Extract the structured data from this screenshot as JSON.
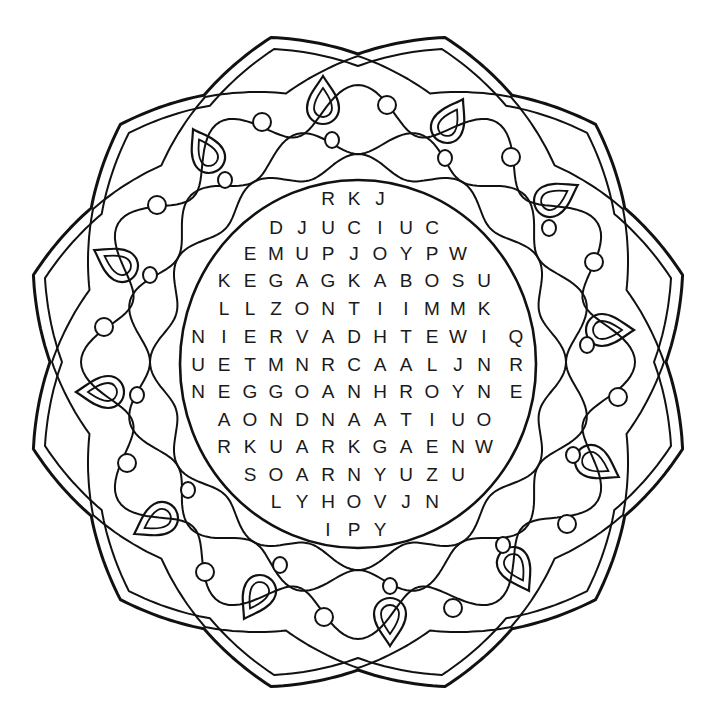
{
  "puzzle": {
    "type": "word-search",
    "style": "mandala coloring page",
    "ink_color": "#111111",
    "background": "#ffffff",
    "grid": {
      "col_x": [
        198,
        224,
        250,
        276,
        302,
        328,
        354,
        380,
        406,
        432,
        458,
        484,
        516
      ],
      "rows": [
        {
          "y": 199,
          "start_col": 5,
          "letters": "RKJ"
        },
        {
          "y": 228,
          "start_col": 3,
          "letters": "DJUCIUC"
        },
        {
          "y": 254,
          "start_col": 2,
          "letters": "EMUPJOYPW"
        },
        {
          "y": 281,
          "start_col": 1,
          "letters": "KEGAGKABOSU"
        },
        {
          "y": 309,
          "start_col": 1,
          "letters": "LLZONTIIMMK"
        },
        {
          "y": 337,
          "start_col": 0,
          "letters": "NIERVADHTEWIQ"
        },
        {
          "y": 365,
          "start_col": 0,
          "letters": "UETMNRCAALJNR"
        },
        {
          "y": 392,
          "start_col": 0,
          "letters": "NEGGOANHROYNE"
        },
        {
          "y": 420,
          "start_col": 1,
          "letters": "AONDNAATIUO"
        },
        {
          "y": 447,
          "start_col": 1,
          "letters": "RKUARKGAENW"
        },
        {
          "y": 475,
          "start_col": 2,
          "letters": "SOARNYUZU"
        },
        {
          "y": 502,
          "start_col": 3,
          "letters": "LYHOVJN"
        },
        {
          "y": 530,
          "start_col": 5,
          "letters": "IPY"
        }
      ]
    },
    "decorations": {
      "center": [
        358,
        362
      ],
      "petal_count": 12,
      "drops": [
        {
          "x": 323,
          "y": 100,
          "rot": 0
        },
        {
          "x": 451,
          "y": 120,
          "rot": 30
        },
        {
          "x": 557,
          "y": 197,
          "rot": 60
        },
        {
          "x": 610,
          "y": 330,
          "rot": 90
        },
        {
          "x": 598,
          "y": 465,
          "rot": 120
        },
        {
          "x": 517,
          "y": 570,
          "rot": 150
        },
        {
          "x": 390,
          "y": 622,
          "rot": 180
        },
        {
          "x": 256,
          "y": 598,
          "rot": 210
        },
        {
          "x": 155,
          "y": 522,
          "rot": 240
        },
        {
          "x": 100,
          "y": 392,
          "rot": 270
        },
        {
          "x": 115,
          "y": 262,
          "rot": 300
        },
        {
          "x": 205,
          "y": 150,
          "rot": 330
        }
      ],
      "small_circles": [
        {
          "x": 332,
          "y": 140
        },
        {
          "x": 445,
          "y": 158
        },
        {
          "x": 549,
          "y": 228
        },
        {
          "x": 587,
          "y": 345
        },
        {
          "x": 573,
          "y": 455
        },
        {
          "x": 503,
          "y": 545
        },
        {
          "x": 390,
          "y": 586
        },
        {
          "x": 280,
          "y": 565
        },
        {
          "x": 188,
          "y": 490
        },
        {
          "x": 137,
          "y": 395
        },
        {
          "x": 150,
          "y": 275
        },
        {
          "x": 225,
          "y": 180
        }
      ],
      "outer_circles": [
        {
          "x": 387,
          "y": 105
        },
        {
          "x": 511,
          "y": 157
        },
        {
          "x": 594,
          "y": 262
        },
        {
          "x": 618,
          "y": 397
        },
        {
          "x": 567,
          "y": 524
        },
        {
          "x": 453,
          "y": 608
        },
        {
          "x": 324,
          "y": 617
        },
        {
          "x": 205,
          "y": 572
        },
        {
          "x": 127,
          "y": 463
        },
        {
          "x": 104,
          "y": 327
        },
        {
          "x": 157,
          "y": 205
        },
        {
          "x": 262,
          "y": 122
        }
      ]
    }
  }
}
